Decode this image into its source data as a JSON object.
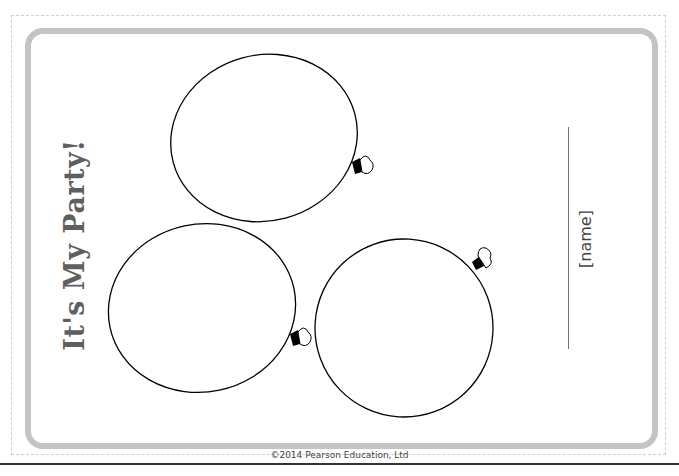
{
  "page": {
    "title": "It's My Party!",
    "name_placeholder": "[name]",
    "copyright": "©2014 Pearson Education, Ltd"
  },
  "balloons": [
    {
      "id": "balloon-top",
      "cx": 264,
      "cy": 138,
      "rx": 94,
      "ry": 83
    },
    {
      "id": "balloon-left",
      "cx": 202,
      "cy": 308,
      "rx": 94,
      "ry": 84
    },
    {
      "id": "balloon-right",
      "cx": 404,
      "cy": 328,
      "rx": 89,
      "ry": 89
    }
  ],
  "colors": {
    "card_border": "#c4c4c4",
    "dash_border": "#cfcfcf",
    "title_text": "#5f5f5f",
    "outline": "#000000"
  }
}
